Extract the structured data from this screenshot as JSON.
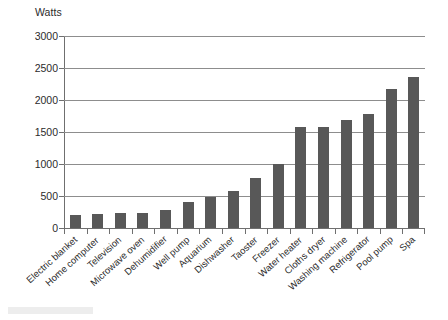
{
  "chart": {
    "y_axis_title": "Watts",
    "y_ticks": [
      "0",
      "500",
      "1000",
      "1500",
      "2000",
      "2500",
      "3000"
    ]
  },
  "chart_data": {
    "type": "bar",
    "title": "",
    "subtitle": "",
    "xlabel": "",
    "ylabel": "Watts",
    "ylim": [
      0,
      3000
    ],
    "ytick_interval": 500,
    "grid": true,
    "legend": false,
    "bar_color": "#585858",
    "categories": [
      "Electric blanket",
      "Home computer",
      "Television",
      "Microwave oven",
      "Dehumidifier",
      "Well pump",
      "Aquarium",
      "Dishwasher",
      "Taoster",
      "Freezer",
      "Water heater",
      "Cloths dryer",
      "Washing machine",
      "Refrigerator",
      "Pool pump",
      "Spa"
    ],
    "values": [
      200,
      215,
      235,
      230,
      275,
      400,
      480,
      580,
      780,
      1000,
      1580,
      1575,
      1680,
      1780,
      2170,
      2360
    ]
  }
}
